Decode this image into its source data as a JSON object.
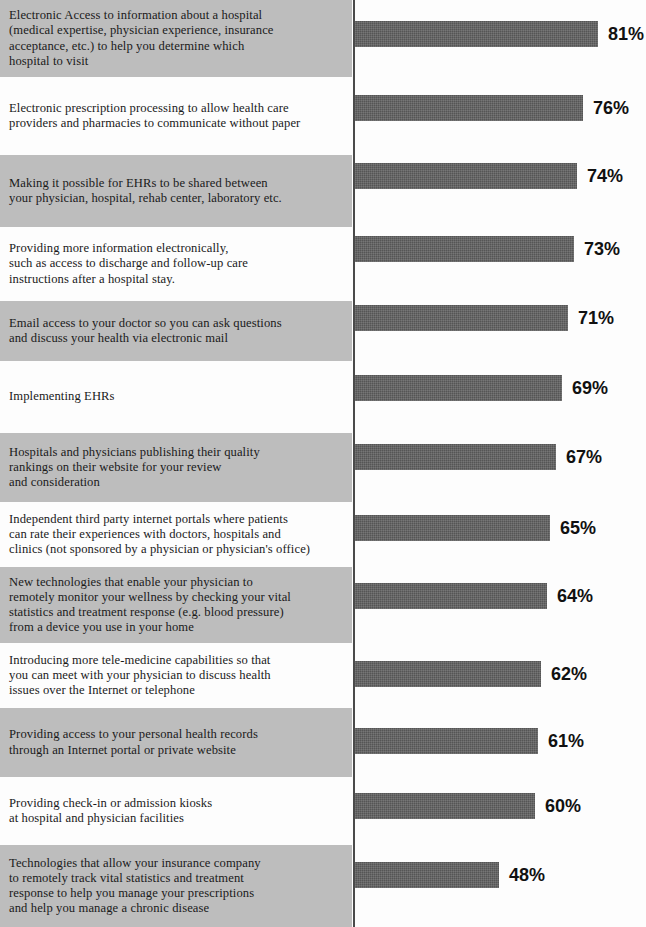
{
  "chart_data": {
    "type": "bar",
    "orientation": "horizontal",
    "title": "",
    "xlabel": "",
    "ylabel": "",
    "xlim": [
      0,
      100
    ],
    "grid": false,
    "legend": null,
    "value_suffix": "%",
    "categories": [
      "Electronic Access to information about a hospital\n(medical expertise, physician experience, insurance\nacceptance, etc.) to help you determine which\nhospital to visit",
      "Electronic prescription processing to allow health care\nproviders and pharmacies to communicate without paper",
      "Making it possible for EHRs to be shared between\nyour physician, hospital, rehab center, laboratory etc.",
      "Providing more information electronically,\nsuch as access to discharge and follow-up care\ninstructions after a hospital stay.",
      "Email access to your doctor so you can ask questions\nand discuss your health via electronic mail",
      "Implementing EHRs",
      "Hospitals and physicians publishing their quality\nrankings on their website for your review\nand consideration",
      "Independent third party internet portals where patients\ncan rate their experiences with doctors, hospitals and\nclinics (not sponsored by a physician or physician's office)",
      "New technologies that enable your physician to\nremotely monitor your wellness by checking your vital\nstatistics and treatment response (e.g. blood pressure)\nfrom a device you use in your home",
      "Introducing more tele-medicine capabilities so that\nyou can meet with your physician to discuss health\nissues over the Internet or telephone",
      "Providing access to your personal health records\nthrough an Internet portal or private website",
      "Providing check-in or admission kiosks\nat hospital and physician facilities",
      "Technologies that allow your insurance company\nto remotely track vital statistics and treatment\nresponse to help you manage your prescriptions\nand help you manage a chronic disease"
    ],
    "values": [
      81,
      76,
      74,
      73,
      71,
      69,
      67,
      65,
      64,
      62,
      61,
      60,
      48
    ],
    "value_labels": [
      "81%",
      "76%",
      "74%",
      "73%",
      "71%",
      "69%",
      "67%",
      "65%",
      "64%",
      "62%",
      "61%",
      "60%",
      "48%"
    ],
    "bar_color": "#555555",
    "shaded_band_color": "#bdbdbd",
    "plain_band_color": "#fdfdfd",
    "value_label_color": "#111111"
  },
  "rows": [
    {
      "label": "Electronic Access to information about a hospital\n(medical expertise, physician experience, insurance\nacceptance, etc.) to help you determine which\nhospital to visit",
      "value": 81,
      "value_label": "81%",
      "shaded": true,
      "band_top": 0,
      "band_height": 77,
      "bar_top": 21
    },
    {
      "label": "Electronic prescription processing to allow health care\nproviders and pharmacies to communicate without paper",
      "value": 76,
      "value_label": "76%",
      "shaded": false,
      "band_top": 77,
      "band_height": 78,
      "bar_top": 95
    },
    {
      "label": "Making it possible for EHRs to be shared between\nyour physician, hospital, rehab center, laboratory etc.",
      "value": 74,
      "value_label": "74%",
      "shaded": true,
      "band_top": 155,
      "band_height": 72,
      "bar_top": 163
    },
    {
      "label": "Providing more information electronically,\nsuch as access to discharge and follow-up care\ninstructions after a hospital stay.",
      "value": 73,
      "value_label": "73%",
      "shaded": false,
      "band_top": 227,
      "band_height": 74,
      "bar_top": 236
    },
    {
      "label": "Email access to your doctor so you can ask questions\nand discuss your health via electronic mail",
      "value": 71,
      "value_label": "71%",
      "shaded": true,
      "band_top": 301,
      "band_height": 60,
      "bar_top": 305
    },
    {
      "label": "Implementing EHRs",
      "value": 69,
      "value_label": "69%",
      "shaded": false,
      "band_top": 361,
      "band_height": 72,
      "bar_top": 375
    },
    {
      "label": "Hospitals and physicians publishing their quality\nrankings on their website for your review\nand consideration",
      "value": 67,
      "value_label": "67%",
      "shaded": true,
      "band_top": 433,
      "band_height": 69,
      "bar_top": 444
    },
    {
      "label": "Independent third party internet portals where patients\ncan rate their experiences with doctors, hospitals and\nclinics (not sponsored by a physician or physician's office)",
      "value": 65,
      "value_label": "65%",
      "shaded": false,
      "band_top": 502,
      "band_height": 65,
      "bar_top": 515
    },
    {
      "label": "New technologies that enable your physician to\nremotely monitor your wellness by checking your vital\nstatistics and treatment response (e.g. blood pressure)\nfrom a device you use in your home",
      "value": 64,
      "value_label": "64%",
      "shaded": true,
      "band_top": 567,
      "band_height": 76,
      "bar_top": 583
    },
    {
      "label": "Introducing more tele-medicine capabilities so that\nyou can meet with your physician to discuss health\nissues over the Internet or telephone",
      "value": 62,
      "value_label": "62%",
      "shaded": false,
      "band_top": 643,
      "band_height": 65,
      "bar_top": 661
    },
    {
      "label": "Providing access to your personal health records\nthrough an Internet portal or private website",
      "value": 61,
      "value_label": "61%",
      "shaded": true,
      "band_top": 708,
      "band_height": 69,
      "bar_top": 728
    },
    {
      "label": "Providing check-in or admission kiosks\nat hospital and physician facilities",
      "value": 60,
      "value_label": "60%",
      "shaded": false,
      "band_top": 777,
      "band_height": 68,
      "bar_top": 793
    },
    {
      "label": "Technologies that allow your insurance company\nto remotely track vital statistics and treatment\nresponse to help you manage your prescriptions\nand help you manage a chronic disease",
      "value": 48,
      "value_label": "48%",
      "shaded": true,
      "band_top": 845,
      "band_height": 82,
      "bar_top": 862
    }
  ]
}
